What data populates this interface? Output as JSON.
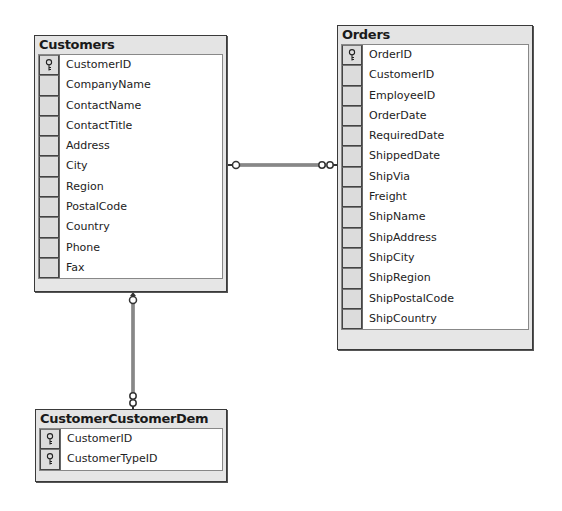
{
  "diagram": {
    "tables": [
      {
        "id": "customers",
        "title": "Customers",
        "columns": [
          {
            "name": "CustomerID",
            "primary_key": true,
            "icon": "key-icon"
          },
          {
            "name": "CompanyName",
            "primary_key": false
          },
          {
            "name": "ContactName",
            "primary_key": false
          },
          {
            "name": "ContactTitle",
            "primary_key": false
          },
          {
            "name": "Address",
            "primary_key": false
          },
          {
            "name": "City",
            "primary_key": false
          },
          {
            "name": "Region",
            "primary_key": false
          },
          {
            "name": "PostalCode",
            "primary_key": false
          },
          {
            "name": "Country",
            "primary_key": false
          },
          {
            "name": "Phone",
            "primary_key": false
          },
          {
            "name": "Fax",
            "primary_key": false
          }
        ]
      },
      {
        "id": "orders",
        "title": "Orders",
        "columns": [
          {
            "name": "OrderID",
            "primary_key": true,
            "icon": "key-icon"
          },
          {
            "name": "CustomerID",
            "primary_key": false
          },
          {
            "name": "EmployeeID",
            "primary_key": false
          },
          {
            "name": "OrderDate",
            "primary_key": false
          },
          {
            "name": "RequiredDate",
            "primary_key": false
          },
          {
            "name": "ShippedDate",
            "primary_key": false
          },
          {
            "name": "ShipVia",
            "primary_key": false
          },
          {
            "name": "Freight",
            "primary_key": false
          },
          {
            "name": "ShipName",
            "primary_key": false
          },
          {
            "name": "ShipAddress",
            "primary_key": false
          },
          {
            "name": "ShipCity",
            "primary_key": false
          },
          {
            "name": "ShipRegion",
            "primary_key": false
          },
          {
            "name": "ShipPostalCode",
            "primary_key": false
          },
          {
            "name": "ShipCountry",
            "primary_key": false
          }
        ]
      },
      {
        "id": "customer-customer-demo",
        "title": "CustomerCustomerDem",
        "columns": [
          {
            "name": "CustomerID",
            "primary_key": true,
            "icon": "key-icon"
          },
          {
            "name": "CustomerTypeID",
            "primary_key": true,
            "icon": "key-icon"
          }
        ]
      }
    ],
    "relationships": [
      {
        "from": "Customers",
        "to": "Orders",
        "type": "one-to-many",
        "icon": "relationship-connector-icon"
      },
      {
        "from": "Customers",
        "to": "CustomerCustomerDem",
        "type": "one-to-many",
        "icon": "relationship-connector-icon"
      }
    ],
    "colors": {
      "border": "#3a3a3a",
      "title_bg": "#e4e4e4",
      "selector_bg": "#dcdcdc",
      "body_bg": "#ffffff"
    }
  }
}
